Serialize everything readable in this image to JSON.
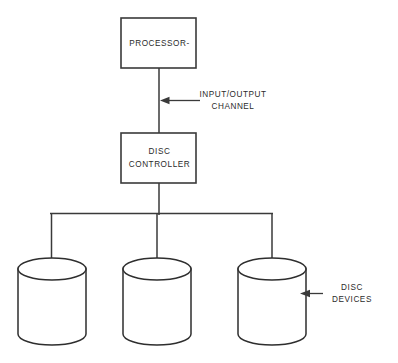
{
  "diagram": {
    "colors": {
      "background": "#ffffff",
      "stroke": "#3a3a3a",
      "cylinder_stroke": "#2e2e2e",
      "text": "#2b2b2b"
    },
    "nodes": [
      {
        "id": "processor",
        "label": "PROCESSOR-",
        "shape": "rectangle",
        "x": 121,
        "y": 18,
        "width": 75,
        "height": 50,
        "label_lines": [
          "PROCESSOR-"
        ]
      },
      {
        "id": "disc-controller",
        "label": "DISC CONTROLLER",
        "shape": "rectangle",
        "x": 121,
        "y": 133,
        "width": 75,
        "height": 50,
        "label_lines": [
          "DISC",
          "CONTROLLER"
        ]
      }
    ],
    "devices": [
      {
        "id": "disc-device-1",
        "shape": "cylinder",
        "cx": 52,
        "top_y": 258,
        "bottom_y": 345,
        "rx": 34,
        "ry": 11
      },
      {
        "id": "disc-device-2",
        "shape": "cylinder",
        "cx": 157,
        "top_y": 258,
        "bottom_y": 345,
        "rx": 34,
        "ry": 11
      },
      {
        "id": "disc-device-3",
        "shape": "cylinder",
        "cx": 272,
        "top_y": 258,
        "bottom_y": 345,
        "rx": 34,
        "ry": 11
      }
    ],
    "connectors": {
      "processor_to_controller": {
        "x": 159,
        "y1": 68,
        "y2": 133
      },
      "controller_to_bus": {
        "x": 159,
        "y1": 183,
        "y2": 213
      },
      "bus": {
        "x1": 50,
        "x2": 272,
        "y": 213
      },
      "drops": [
        {
          "x": 52,
          "y1": 213,
          "y2": 269
        },
        {
          "x": 157,
          "y1": 213,
          "y2": 269
        },
        {
          "x": 272,
          "y1": 213,
          "y2": 269
        }
      ]
    },
    "callouts": [
      {
        "id": "input-output-channel",
        "label_lines": [
          "INPUT/OUTPUT",
          "CHANNEL"
        ],
        "arrow_tip_x": 161,
        "arrow_tip_y": 100,
        "line_end_x": 200,
        "text_x": 233,
        "text_y1": 95,
        "text_y2": 106
      },
      {
        "id": "disc-devices",
        "label_lines": [
          "DISC",
          "DEVICES"
        ],
        "arrow_tip_x": 301,
        "arrow_tip_y": 293,
        "line_end_x": 323,
        "text_x": 352,
        "text_y1": 288,
        "text_y2": 299
      }
    ]
  }
}
